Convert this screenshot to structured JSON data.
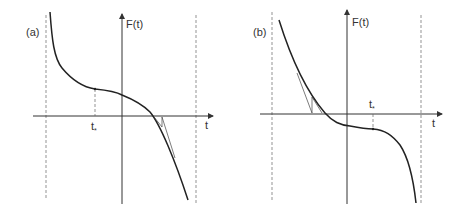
{
  "figure": {
    "panels": [
      {
        "id": "a",
        "label": "(a)",
        "y_axis_label": "F(t)",
        "x_axis_label": "t",
        "marker_label": "t",
        "marker_subscript": "*",
        "description": "Decreasing curve with inflection plateau at t* (left of origin, F>0); Newton tangent iterations near root on right side"
      },
      {
        "id": "b",
        "label": "(b)",
        "y_axis_label": "F(t)",
        "x_axis_label": "t",
        "marker_label": "t",
        "marker_subscript": "*",
        "description": "Decreasing curve with inflection plateau at t* (right of origin, F<0); Newton tangent iterations near root on left side"
      }
    ],
    "colors": {
      "curve": "#222222",
      "axis": "#333333",
      "dashed": "#666666",
      "background": "#ffffff"
    }
  }
}
